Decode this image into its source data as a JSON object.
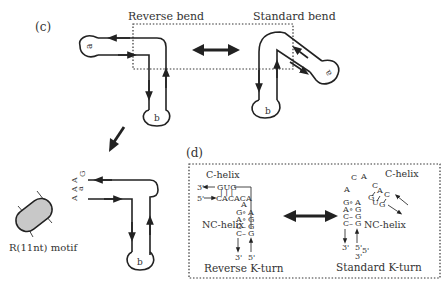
{
  "panel_c": {
    "label": "(c)",
    "reverse_bend_label": "Reverse bend",
    "standard_bend_label": "Standard bend",
    "loop_a": "a",
    "loop_b": "b",
    "loop_a_rotated": "a",
    "loop_b2": "b"
  },
  "motif": {
    "label": "R(11nt) motif",
    "fill_color": "#c8c8c8",
    "nuc1": "A",
    "nuc2": "A",
    "nuc3": "G",
    "nuc4": "A",
    "loop_a": "a",
    "loop_b": "b"
  },
  "panel_d": {
    "label": "(d)",
    "reverse": {
      "c_helix": "C-helix",
      "nc_helix": "NC-helix",
      "title": "Reverse K-turn",
      "three_prime_top": "3'",
      "five_prime_top": "5'",
      "top_strand": "GUG",
      "bottom_strand": "CACACA",
      "sub_a": "A",
      "pairs": [
        {
          "left": "G",
          "mid": "∘",
          "right": "A"
        },
        {
          "left": "A",
          "mid": "∘",
          "right": "G"
        },
        {
          "left": "C",
          "mid": "–",
          "right": "G"
        },
        {
          "left": "C",
          "mid": "–",
          "right": "G"
        }
      ],
      "end3": "3'",
      "end5": "5'"
    },
    "standard": {
      "c_helix": "C-helix",
      "nc_helix": "NC-helix",
      "title": "Standard K-turn",
      "loop_c": "C",
      "loop_a1": "A",
      "loop_a2": "A",
      "cac_c1": "C",
      "cac_a": "A",
      "cac_c2": "C",
      "gug_g1": "G",
      "gug_u": "U",
      "gug_g2": "G",
      "pairs": [
        {
          "left": "G",
          "mid": "∘",
          "right": "A"
        },
        {
          "left": "A",
          "mid": "∘",
          "right": "G"
        },
        {
          "left": "C",
          "mid": "–",
          "right": "G"
        },
        {
          "left": "C",
          "mid": "–",
          "right": "G"
        }
      ],
      "end3": "3'",
      "end5a": "5'",
      "end5b": "5'",
      "end3b": "3'"
    }
  }
}
